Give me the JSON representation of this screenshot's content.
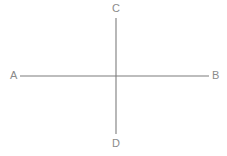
{
  "figure": {
    "background_color": "#ffffff",
    "line_color": "#7d7d7d",
    "label_color": "#8a8a8a",
    "labels": {
      "a": "A",
      "b": "B",
      "c": "C",
      "d": "D"
    },
    "segments": [
      {
        "name": "AB",
        "orientation": "horizontal",
        "x1": 20,
        "y1": 76,
        "x2": 209,
        "y2": 76
      },
      {
        "name": "CD",
        "orientation": "vertical",
        "x1": 116,
        "y1": 18,
        "x2": 116,
        "y2": 134
      }
    ],
    "intersection": {
      "x": 116,
      "y": 76
    }
  }
}
